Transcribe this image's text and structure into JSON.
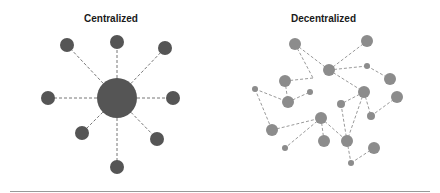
{
  "centralized": {
    "title": "Centralized",
    "color": "#555555",
    "edge_color": "#777777",
    "hub": {
      "x": 117,
      "y": 98,
      "r": 20
    },
    "nodes": [
      {
        "x": 67,
        "y": 45,
        "r": 7
      },
      {
        "x": 117,
        "y": 42,
        "r": 7
      },
      {
        "x": 165,
        "y": 48,
        "r": 7
      },
      {
        "x": 48,
        "y": 98,
        "r": 7
      },
      {
        "x": 173,
        "y": 98,
        "r": 7
      },
      {
        "x": 82,
        "y": 133,
        "r": 7
      },
      {
        "x": 157,
        "y": 139,
        "r": 7
      },
      {
        "x": 117,
        "y": 167,
        "r": 7
      }
    ]
  },
  "decentralized": {
    "title": "Decentralized",
    "color": "#8c8c8c",
    "edge_color": "#9a9a9a",
    "nodes": [
      {
        "x": 295,
        "y": 44,
        "r": 6
      },
      {
        "x": 367,
        "y": 41,
        "r": 6
      },
      {
        "x": 329,
        "y": 70,
        "r": 6
      },
      {
        "x": 367,
        "y": 66,
        "r": 3
      },
      {
        "x": 390,
        "y": 79,
        "r": 6
      },
      {
        "x": 285,
        "y": 81,
        "r": 6
      },
      {
        "x": 255,
        "y": 89,
        "r": 3
      },
      {
        "x": 310,
        "y": 92,
        "r": 3
      },
      {
        "x": 288,
        "y": 102,
        "r": 6
      },
      {
        "x": 364,
        "y": 92,
        "r": 6
      },
      {
        "x": 397,
        "y": 97,
        "r": 6
      },
      {
        "x": 341,
        "y": 104,
        "r": 4
      },
      {
        "x": 371,
        "y": 116,
        "r": 4
      },
      {
        "x": 321,
        "y": 118,
        "r": 6
      },
      {
        "x": 272,
        "y": 130,
        "r": 6
      },
      {
        "x": 324,
        "y": 141,
        "r": 6
      },
      {
        "x": 347,
        "y": 141,
        "r": 6
      },
      {
        "x": 285,
        "y": 148,
        "r": 3
      },
      {
        "x": 374,
        "y": 148,
        "r": 6
      },
      {
        "x": 351,
        "y": 163,
        "r": 3
      }
    ],
    "edges": [
      [
        [
          295,
          44
        ],
        [
          329,
          70
        ]
      ],
      [
        [
          295,
          44
        ],
        [
          313,
          78
        ]
      ],
      [
        [
          313,
          78
        ],
        [
          285,
          81
        ]
      ],
      [
        [
          329,
          70
        ],
        [
          367,
          41
        ]
      ],
      [
        [
          329,
          70
        ],
        [
          367,
          66
        ]
      ],
      [
        [
          367,
          66
        ],
        [
          390,
          79
        ]
      ],
      [
        [
          329,
          70
        ],
        [
          364,
          92
        ]
      ],
      [
        [
          285,
          81
        ],
        [
          288,
          102
        ]
      ],
      [
        [
          255,
          89
        ],
        [
          288,
          102
        ]
      ],
      [
        [
          288,
          102
        ],
        [
          310,
          92
        ]
      ],
      [
        [
          255,
          89
        ],
        [
          272,
          130
        ]
      ],
      [
        [
          272,
          130
        ],
        [
          321,
          118
        ]
      ],
      [
        [
          321,
          118
        ],
        [
          285,
          148
        ]
      ],
      [
        [
          321,
          118
        ],
        [
          324,
          141
        ]
      ],
      [
        [
          321,
          118
        ],
        [
          347,
          141
        ]
      ],
      [
        [
          364,
          92
        ],
        [
          341,
          104
        ]
      ],
      [
        [
          364,
          92
        ],
        [
          347,
          141
        ]
      ],
      [
        [
          341,
          104
        ],
        [
          347,
          141
        ]
      ],
      [
        [
          364,
          92
        ],
        [
          371,
          116
        ]
      ],
      [
        [
          371,
          116
        ],
        [
          397,
          97
        ]
      ],
      [
        [
          347,
          141
        ],
        [
          351,
          163
        ]
      ],
      [
        [
          351,
          163
        ],
        [
          374,
          148
        ]
      ]
    ]
  }
}
